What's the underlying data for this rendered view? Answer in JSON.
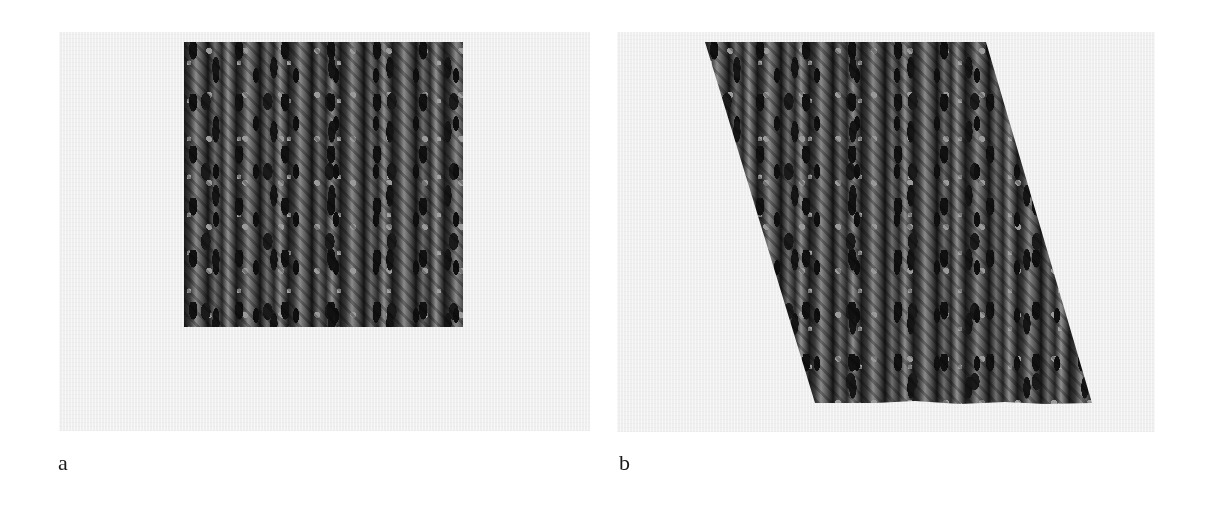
{
  "figure": {
    "panels": [
      {
        "label": "a",
        "description": "Original square texture patch (knitted cable pattern) on light gray background",
        "shape": "square"
      },
      {
        "label": "b",
        "description": "Same texture patch warped into a slanted parallelogram with a wavy bottom edge",
        "shape": "parallelogram"
      }
    ],
    "colors": {
      "background": "#efefef",
      "texture_dark": "#111111",
      "texture_light": "#9a9a9a",
      "label": "#1a1a1a"
    }
  }
}
